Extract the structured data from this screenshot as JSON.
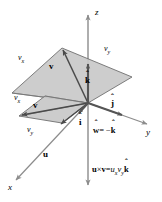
{
  "figure": {
    "colors": {
      "background": "#ffffff",
      "plane_fill": "#c8c8c8",
      "plane_stroke": "#6e6e6e",
      "axis": "#8c8c8c",
      "vector": "#555555",
      "text": "#000000"
    },
    "axes": [
      {
        "name": "z",
        "label": "z"
      },
      {
        "name": "y",
        "label": "y"
      },
      {
        "name": "x",
        "label": "x"
      }
    ],
    "upper_plane": {
      "vector_label": "v",
      "component_x_label": "v",
      "component_x_sub": "x",
      "component_y_label": "v",
      "component_y_sub": "y"
    },
    "lower_plane": {
      "vector_label": "v",
      "component_x_label": "v",
      "component_x_sub": "x",
      "component_y_label": "v",
      "component_y_sub": "y"
    },
    "unit_vectors": [
      {
        "name": "k-hat",
        "label": "k"
      },
      {
        "name": "j-hat",
        "label": "j"
      },
      {
        "name": "i-hat",
        "label": "i"
      }
    ],
    "u_vector_label": "u",
    "w_equation": {
      "w": "w",
      "equals": "= −",
      "k": "k"
    },
    "cross_product_equation": {
      "u": "u",
      "times": "×",
      "v": "v",
      "equals": "=",
      "ux": "u",
      "ux_sub": "x",
      "vy": "v",
      "vy_sub": "y",
      "k": "k"
    }
  }
}
